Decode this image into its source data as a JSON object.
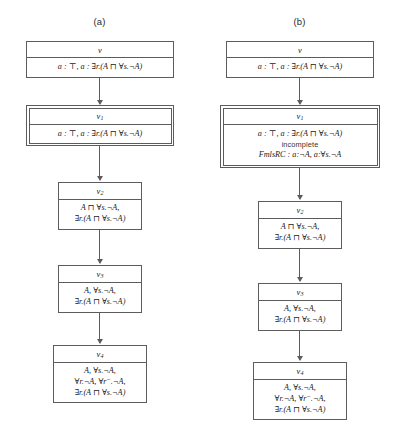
{
  "figure": {
    "panels": [
      {
        "key": "a",
        "label": "(a)",
        "nodes": [
          {
            "key": "root",
            "name": "node-nu",
            "head": "ν",
            "head_sub": "",
            "double_border": false,
            "lines": [
              {
                "text": "a : ⊤, a : ∃r.(A ⊓ ∀s.¬A)",
                "style": "formula"
              }
            ]
          },
          {
            "key": "v1",
            "name": "node-v1",
            "head": "v",
            "head_sub": "1",
            "double_border": true,
            "lines": [
              {
                "text": "a : ⊤, a : ∃r.(A ⊓ ∀s.¬A)",
                "style": "formula"
              }
            ]
          },
          {
            "key": "v2",
            "name": "node-v2",
            "head": "v",
            "head_sub": "2",
            "double_border": false,
            "lines": [
              {
                "text": "A ⊓ ∀s.¬A,",
                "style": "formula"
              },
              {
                "text": "∃r.(A ⊓ ∀s.¬A)",
                "style": "formula"
              }
            ]
          },
          {
            "key": "v3",
            "name": "node-v3",
            "head": "v",
            "head_sub": "3",
            "double_border": false,
            "lines": [
              {
                "text": "A, ∀s.¬A,",
                "style": "formula"
              },
              {
                "text": "∃r.(A ⊓ ∀s.¬A)",
                "style": "formula"
              }
            ]
          },
          {
            "key": "v4",
            "name": "node-v4",
            "head": "v",
            "head_sub": "4",
            "double_border": false,
            "lines": [
              {
                "text": "A, ∀s.¬A,",
                "style": "formula"
              },
              {
                "text": "∀r.¬A, ∀r⁻.¬A,",
                "style": "formula"
              },
              {
                "text": "∃r.(A ⊓ ∀s.¬A)",
                "style": "formula"
              }
            ]
          }
        ]
      },
      {
        "key": "b",
        "label": "(b)",
        "nodes": [
          {
            "key": "root",
            "name": "node-nu",
            "head": "ν",
            "head_sub": "",
            "double_border": false,
            "lines": [
              {
                "text": "a : ⊤, a : ∃r.(A ⊓ ∀s.¬A)",
                "style": "formula"
              }
            ]
          },
          {
            "key": "v1",
            "name": "node-v1",
            "head": "v",
            "head_sub": "1",
            "double_border": true,
            "lines": [
              {
                "text": "a : ⊤, a : ∃r.(A ⊓ ∀s.¬A)",
                "style": "formula"
              },
              {
                "text": "incomplete",
                "style": "incomplete"
              },
              {
                "text": "FmlsRC : a:¬A, a:∀s.¬A",
                "style": "fmlsrc"
              }
            ]
          },
          {
            "key": "v2",
            "name": "node-v2",
            "head": "v",
            "head_sub": "2",
            "double_border": false,
            "lines": [
              {
                "text": "A ⊓ ∀s.¬A,",
                "style": "formula"
              },
              {
                "text": "∃r.(A ⊓ ∀s.¬A)",
                "style": "formula"
              }
            ]
          },
          {
            "key": "v3",
            "name": "node-v3",
            "head": "v",
            "head_sub": "3",
            "double_border": false,
            "lines": [
              {
                "text": "A, ∀s.¬A,",
                "style": "formula"
              },
              {
                "text": "∃r.(A ⊓ ∀s.¬A)",
                "style": "formula"
              }
            ]
          },
          {
            "key": "v4",
            "name": "node-v4",
            "head": "v",
            "head_sub": "4",
            "double_border": false,
            "lines": [
              {
                "text": "A, ∀s.¬A,",
                "style": "formula"
              },
              {
                "text": "∀r.¬A, ∀r⁻.¬A,",
                "style": "formula"
              },
              {
                "text": "∃r.(A ⊓ ∀s.¬A)",
                "style": "formula"
              }
            ]
          }
        ]
      }
    ]
  }
}
